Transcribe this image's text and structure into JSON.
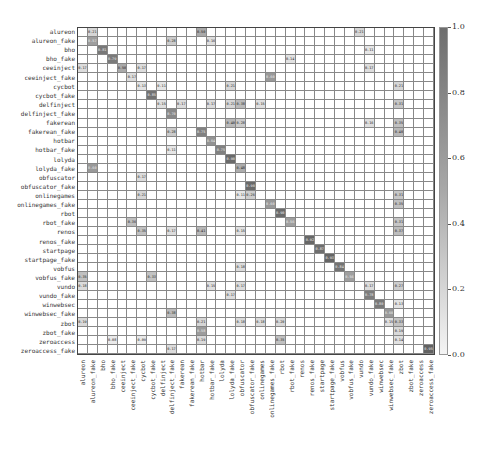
{
  "chart_data": {
    "type": "heatmap",
    "title": "",
    "xlabel": "",
    "ylabel": "",
    "labels": [
      "alureon",
      "alureon_fake",
      "bho",
      "bho_fake",
      "ceeinject",
      "ceeinject_fake",
      "cycbot",
      "cycbot_fake",
      "delfinject",
      "delfinject_fake",
      "fakerean",
      "fakerean_fake",
      "hotbar",
      "hotbar_fake",
      "lolyda",
      "lolyda_fake",
      "obfuscator",
      "obfuscator_fake",
      "onlinegames",
      "onlinegames_fake",
      "rbot",
      "rbot_fake",
      "renos",
      "renos_fake",
      "startpage",
      "startpage_fake",
      "vobfus",
      "vobfus_fake",
      "vundo",
      "vundo_fake",
      "winwebsec",
      "winwebsec_fake",
      "zbot",
      "zbot_fake",
      "zeroaccess",
      "zeroaccess_fake"
    ],
    "colorbar": {
      "min": 0.0,
      "max": 1.0,
      "ticks": [
        "1.0",
        "0.8",
        "0.6",
        "0.4",
        "0.2",
        "0.0"
      ],
      "cmap": "greys"
    },
    "cells": [
      [
        0,
        1,
        0.21
      ],
      [
        0,
        12,
        0.5
      ],
      [
        0,
        28,
        0.21
      ],
      [
        1,
        1,
        0.57
      ],
      [
        1,
        9,
        0.28
      ],
      [
        1,
        13,
        0.16
      ],
      [
        2,
        2,
        0.81
      ],
      [
        2,
        29,
        0.11
      ],
      [
        3,
        3,
        0.79
      ],
      [
        3,
        21,
        0.14
      ],
      [
        4,
        0,
        0.17
      ],
      [
        4,
        4,
        0.5
      ],
      [
        4,
        6,
        0.17
      ],
      [
        4,
        29,
        0.17
      ],
      [
        5,
        5,
        0.17
      ],
      [
        5,
        19,
        0.6
      ],
      [
        6,
        6,
        0.13
      ],
      [
        6,
        8,
        0.11
      ],
      [
        6,
        15,
        0.21
      ],
      [
        6,
        32,
        0.21
      ],
      [
        7,
        7,
        0.85
      ],
      [
        8,
        8,
        0.15
      ],
      [
        8,
        10,
        0.17
      ],
      [
        8,
        13,
        0.17
      ],
      [
        8,
        15,
        0.21
      ],
      [
        8,
        16,
        0.38
      ],
      [
        8,
        18,
        0.15
      ],
      [
        8,
        32,
        0.31
      ],
      [
        9,
        9,
        0.7
      ],
      [
        10,
        15,
        0.4
      ],
      [
        10,
        16,
        0.28
      ],
      [
        10,
        29,
        0.16
      ],
      [
        10,
        32,
        0.35
      ],
      [
        11,
        9,
        0.28
      ],
      [
        11,
        12,
        0.75
      ],
      [
        11,
        32,
        0.4
      ],
      [
        12,
        13,
        0.64
      ],
      [
        13,
        9,
        0.11
      ],
      [
        13,
        14,
        0.75
      ],
      [
        14,
        15,
        0.9
      ],
      [
        15,
        1,
        0.6
      ],
      [
        15,
        16,
        0.48
      ],
      [
        16,
        6,
        0.17
      ],
      [
        17,
        17,
        0.9
      ],
      [
        18,
        6,
        0.21
      ],
      [
        18,
        16,
        0.11
      ],
      [
        18,
        17,
        0.26
      ],
      [
        18,
        32,
        0.31
      ],
      [
        19,
        19,
        0.6
      ],
      [
        19,
        32,
        0.35
      ],
      [
        20,
        20,
        0.9
      ],
      [
        21,
        5,
        0.36
      ],
      [
        21,
        21,
        0.56
      ],
      [
        21,
        32,
        0.31
      ],
      [
        22,
        6,
        0.35
      ],
      [
        22,
        9,
        0.17
      ],
      [
        22,
        12,
        0.41
      ],
      [
        22,
        16,
        0.15
      ],
      [
        22,
        32,
        0.37
      ],
      [
        23,
        23,
        0.92
      ],
      [
        24,
        24,
        0.87
      ],
      [
        25,
        25,
        0.93
      ],
      [
        26,
        16,
        0.18
      ],
      [
        26,
        26,
        0.84
      ],
      [
        27,
        0,
        0.35
      ],
      [
        27,
        7,
        0.33
      ],
      [
        27,
        27,
        0.56
      ],
      [
        28,
        0,
        0.18
      ],
      [
        28,
        13,
        0.15
      ],
      [
        28,
        16,
        0.17
      ],
      [
        28,
        29,
        0.17
      ],
      [
        28,
        32,
        0.27
      ],
      [
        29,
        15,
        0.17
      ],
      [
        29,
        29,
        0.78
      ],
      [
        30,
        30,
        0.8
      ],
      [
        30,
        32,
        0.13
      ],
      [
        31,
        9,
        0.38
      ],
      [
        31,
        31,
        0.6
      ],
      [
        32,
        0,
        0.19
      ],
      [
        32,
        12,
        0.21
      ],
      [
        32,
        16,
        0.18
      ],
      [
        32,
        18,
        0.18
      ],
      [
        32,
        20,
        0.2
      ],
      [
        32,
        31,
        0.15
      ],
      [
        32,
        32,
        0.33
      ],
      [
        33,
        12,
        0.58
      ],
      [
        33,
        32,
        0.19
      ],
      [
        34,
        3,
        0.08
      ],
      [
        34,
        6,
        0.09
      ],
      [
        34,
        12,
        0.19
      ],
      [
        34,
        20,
        0.35
      ],
      [
        34,
        32,
        0.14
      ],
      [
        35,
        9,
        0.17
      ],
      [
        35,
        35,
        0.95
      ]
    ]
  }
}
